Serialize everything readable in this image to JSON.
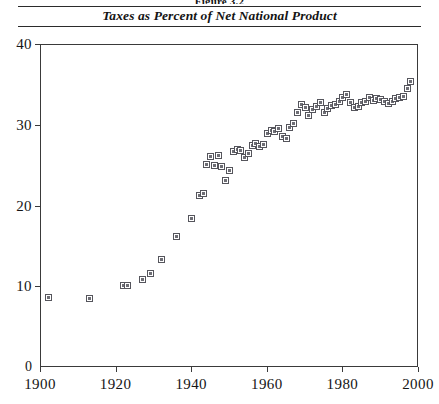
{
  "figure": {
    "number_label": "Figure 3.2",
    "title": "Taxes as Percent of Net National Product"
  },
  "chart_data": {
    "type": "scatter",
    "title": "Taxes as Percent of Net National Product",
    "xlabel": "",
    "ylabel": "",
    "xlim": [
      1900,
      2000
    ],
    "ylim": [
      0,
      40
    ],
    "xticks": [
      1900,
      1920,
      1940,
      1960,
      1980,
      2000
    ],
    "xticklabels": [
      "1900",
      "1920",
      "1940",
      "1960",
      "1980",
      "2000"
    ],
    "yticks": [
      0,
      10,
      20,
      30,
      40
    ],
    "yticklabels": [
      "0",
      "10",
      "20",
      "30",
      "40"
    ],
    "grid": false,
    "legend": null,
    "marker": "open-square",
    "points": [
      {
        "x": 1902,
        "y": 8.7
      },
      {
        "x": 1913,
        "y": 8.5
      },
      {
        "x": 1922,
        "y": 10.2
      },
      {
        "x": 1923,
        "y": 10.1
      },
      {
        "x": 1927,
        "y": 10.9
      },
      {
        "x": 1929,
        "y": 11.6
      },
      {
        "x": 1932,
        "y": 13.4
      },
      {
        "x": 1936,
        "y": 16.2
      },
      {
        "x": 1940,
        "y": 18.4
      },
      {
        "x": 1942,
        "y": 21.3
      },
      {
        "x": 1943,
        "y": 21.6
      },
      {
        "x": 1944,
        "y": 25.2
      },
      {
        "x": 1945,
        "y": 26.1
      },
      {
        "x": 1946,
        "y": 25.0
      },
      {
        "x": 1947,
        "y": 26.3
      },
      {
        "x": 1948,
        "y": 24.9
      },
      {
        "x": 1949,
        "y": 23.1
      },
      {
        "x": 1950,
        "y": 24.4
      },
      {
        "x": 1951,
        "y": 26.8
      },
      {
        "x": 1952,
        "y": 27.0
      },
      {
        "x": 1953,
        "y": 26.9
      },
      {
        "x": 1954,
        "y": 26.0
      },
      {
        "x": 1955,
        "y": 26.5
      },
      {
        "x": 1956,
        "y": 27.5
      },
      {
        "x": 1957,
        "y": 27.8
      },
      {
        "x": 1958,
        "y": 27.4
      },
      {
        "x": 1959,
        "y": 27.6
      },
      {
        "x": 1960,
        "y": 29.0
      },
      {
        "x": 1961,
        "y": 29.3
      },
      {
        "x": 1962,
        "y": 29.2
      },
      {
        "x": 1963,
        "y": 29.6
      },
      {
        "x": 1964,
        "y": 28.6
      },
      {
        "x": 1965,
        "y": 28.4
      },
      {
        "x": 1966,
        "y": 29.7
      },
      {
        "x": 1967,
        "y": 30.2
      },
      {
        "x": 1968,
        "y": 31.6
      },
      {
        "x": 1969,
        "y": 32.6
      },
      {
        "x": 1970,
        "y": 32.2
      },
      {
        "x": 1971,
        "y": 31.2
      },
      {
        "x": 1972,
        "y": 32.0
      },
      {
        "x": 1973,
        "y": 32.3
      },
      {
        "x": 1974,
        "y": 32.8
      },
      {
        "x": 1975,
        "y": 31.6
      },
      {
        "x": 1976,
        "y": 32.1
      },
      {
        "x": 1977,
        "y": 32.5
      },
      {
        "x": 1978,
        "y": 32.6
      },
      {
        "x": 1979,
        "y": 33.0
      },
      {
        "x": 1980,
        "y": 33.4
      },
      {
        "x": 1981,
        "y": 33.8
      },
      {
        "x": 1982,
        "y": 32.8
      },
      {
        "x": 1983,
        "y": 32.2
      },
      {
        "x": 1984,
        "y": 32.3
      },
      {
        "x": 1985,
        "y": 32.8
      },
      {
        "x": 1986,
        "y": 32.9
      },
      {
        "x": 1987,
        "y": 33.4
      },
      {
        "x": 1988,
        "y": 33.1
      },
      {
        "x": 1989,
        "y": 33.3
      },
      {
        "x": 1990,
        "y": 33.2
      },
      {
        "x": 1991,
        "y": 33.0
      },
      {
        "x": 1992,
        "y": 32.7
      },
      {
        "x": 1993,
        "y": 33.0
      },
      {
        "x": 1994,
        "y": 33.3
      },
      {
        "x": 1995,
        "y": 33.4
      },
      {
        "x": 1996,
        "y": 33.6
      },
      {
        "x": 1997,
        "y": 34.6
      },
      {
        "x": 1998,
        "y": 35.4
      }
    ]
  }
}
